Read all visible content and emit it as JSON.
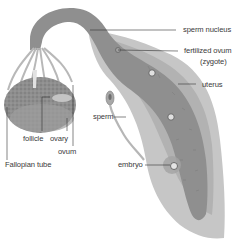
{
  "diagram": {
    "labels": {
      "sperm_nucleus": "sperm nucleus",
      "fertilized_ovum": "fertilized ovum",
      "zygote": "(zygote)",
      "uterus": "uterus",
      "sperm": "sperm",
      "embryo": "embryo",
      "follicle": "follicle",
      "ovary": "ovary",
      "ovum": "ovum",
      "fallopian_tube": "Fallopian tube"
    },
    "colors": {
      "background": "#ffffff",
      "tube_dark": "#8c8c8c",
      "tube_mid": "#a9a9a9",
      "tube_light": "#c9c9c9",
      "outer_wall": "#bdbdbd",
      "ovary": "#9a9a9a",
      "leader_line": "#333333",
      "label_text": "#3a3a3a"
    }
  }
}
